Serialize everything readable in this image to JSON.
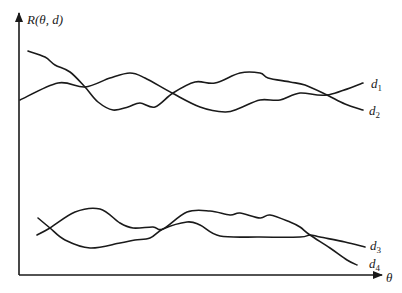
{
  "chart_data": {
    "type": "line",
    "title": "",
    "ylabel": "R(θ, d)",
    "xlabel": "θ",
    "grid": false,
    "ticks": "none",
    "legend": "inline labels at right end of each curve",
    "series": [
      {
        "name": "d1",
        "label_main": "d",
        "label_sub": "1",
        "points": [
          [
            20,
            100
          ],
          [
            58,
            83
          ],
          [
            85,
            87
          ],
          [
            110,
            78
          ],
          [
            130,
            73
          ],
          [
            145,
            78
          ],
          [
            172,
            93
          ],
          [
            200,
            107
          ],
          [
            225,
            112
          ],
          [
            240,
            108
          ],
          [
            260,
            100
          ],
          [
            280,
            100
          ],
          [
            300,
            93
          ],
          [
            327,
            95
          ],
          [
            363,
            83
          ]
        ]
      },
      {
        "name": "d2",
        "label_main": "d",
        "label_sub": "2",
        "points": [
          [
            28,
            51
          ],
          [
            45,
            57
          ],
          [
            55,
            65
          ],
          [
            70,
            72
          ],
          [
            85,
            87
          ],
          [
            98,
            102
          ],
          [
            113,
            110
          ],
          [
            128,
            107
          ],
          [
            140,
            103
          ],
          [
            155,
            107
          ],
          [
            173,
            93
          ],
          [
            195,
            82
          ],
          [
            215,
            83
          ],
          [
            240,
            73
          ],
          [
            260,
            73
          ],
          [
            268,
            78
          ],
          [
            290,
            82
          ],
          [
            305,
            85
          ],
          [
            327,
            95
          ],
          [
            345,
            104
          ],
          [
            363,
            110
          ]
        ]
      },
      {
        "name": "d3",
        "label_main": "d",
        "label_sub": "3",
        "points": [
          [
            38,
            218
          ],
          [
            50,
            228
          ],
          [
            65,
            240
          ],
          [
            90,
            248
          ],
          [
            120,
            243
          ],
          [
            135,
            240
          ],
          [
            150,
            238
          ],
          [
            163,
            229
          ],
          [
            187,
            222
          ],
          [
            200,
            225
          ],
          [
            220,
            236
          ],
          [
            260,
            237
          ],
          [
            300,
            237
          ],
          [
            310,
            235
          ],
          [
            320,
            237
          ],
          [
            345,
            242
          ],
          [
            365,
            247
          ]
        ]
      },
      {
        "name": "d4",
        "label_main": "d",
        "label_sub": "4",
        "points": [
          [
            37,
            235
          ],
          [
            50,
            228
          ],
          [
            75,
            212
          ],
          [
            100,
            209
          ],
          [
            120,
            223
          ],
          [
            133,
            228
          ],
          [
            153,
            227
          ],
          [
            163,
            229
          ],
          [
            187,
            212
          ],
          [
            210,
            211
          ],
          [
            230,
            215
          ],
          [
            240,
            213
          ],
          [
            260,
            218
          ],
          [
            270,
            215
          ],
          [
            290,
            222
          ],
          [
            300,
            227
          ],
          [
            310,
            235
          ],
          [
            330,
            248
          ],
          [
            347,
            260
          ],
          [
            357,
            265
          ]
        ]
      }
    ]
  },
  "axes": {
    "y_label": "R(θ, d)",
    "x_label": "θ"
  },
  "labels": {
    "d1": {
      "main": "d",
      "sub": "1"
    },
    "d2": {
      "main": "d",
      "sub": "2"
    },
    "d3": {
      "main": "d",
      "sub": "3"
    },
    "d4": {
      "main": "d",
      "sub": "4"
    }
  }
}
